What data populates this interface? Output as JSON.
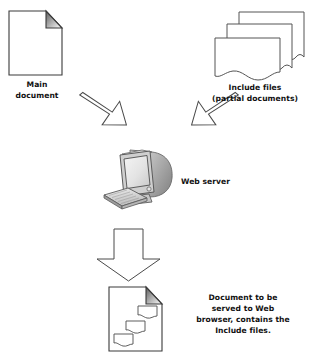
{
  "diagram": {
    "background_color": "#ffffff",
    "stroke_color": "#3a3a3a",
    "text_color": "#111111",
    "nodes": [
      {
        "id": "main-document",
        "icon": "page-folded-corner-icon",
        "label": "Main\ndocument"
      },
      {
        "id": "include-files",
        "icon": "stacked-torn-pages-icon",
        "label": "Include files\n(partial documents)"
      },
      {
        "id": "web-server",
        "icon": "crt-monitor-keyboard-icon",
        "label": "Web server"
      },
      {
        "id": "output-document",
        "icon": "page-with-includes-icon",
        "label": "Document to be\nserved to Web\nbrowser, contains the\nInclude files."
      }
    ],
    "arrows": [
      {
        "id": "arrow-main-to-server",
        "icon": "block-arrow-down-right-icon",
        "direction": "down-right"
      },
      {
        "id": "arrow-includes-to-server",
        "icon": "block-arrow-down-left-icon",
        "direction": "down-left"
      },
      {
        "id": "arrow-server-to-output",
        "icon": "block-arrow-down-icon",
        "direction": "down"
      }
    ]
  }
}
